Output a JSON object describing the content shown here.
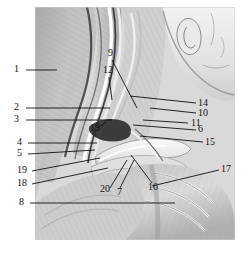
{
  "figure": {
    "view": "right lateral",
    "background_color": "#ffffff",
    "plate_color": "#dcdcdc",
    "ink_color": "#141414",
    "label_count": 20
  },
  "labels": [
    {
      "id": "1",
      "text": "1",
      "tx": 14,
      "ty": 72,
      "lx1": 26,
      "ly1": 70,
      "lx2": 57,
      "ly2": 70
    },
    {
      "id": "2",
      "text": "2",
      "tx": 14,
      "ty": 110,
      "lx1": 26,
      "ly1": 108,
      "lx2": 110,
      "ly2": 108
    },
    {
      "id": "3",
      "text": "3",
      "tx": 14,
      "ty": 122,
      "lx1": 26,
      "ly1": 120,
      "lx2": 112,
      "ly2": 120
    },
    {
      "id": "4",
      "text": "4",
      "tx": 17,
      "ty": 145,
      "lx1": 28,
      "ly1": 143,
      "lx2": 97,
      "ly2": 143
    },
    {
      "id": "5",
      "text": "5",
      "tx": 17,
      "ty": 156,
      "lx1": 28,
      "ly1": 154,
      "lx2": 95,
      "ly2": 150
    },
    {
      "id": "6",
      "text": "6",
      "tx": 198,
      "ty": 132,
      "lx1": 196,
      "ly1": 130,
      "lx2": 133,
      "ly2": 125
    },
    {
      "id": "7",
      "text": "7",
      "tx": 117,
      "ty": 195,
      "lx1": 120,
      "ly1": 188,
      "lx2": 134,
      "ly2": 160
    },
    {
      "id": "8",
      "text": "8",
      "tx": 19,
      "ty": 205,
      "lx1": 30,
      "ly1": 203,
      "lx2": 175,
      "ly2": 203
    },
    {
      "id": "9",
      "text": "9",
      "tx": 108,
      "ty": 56,
      "lx1": 112,
      "ly1": 60,
      "lx2": 137,
      "ly2": 108
    },
    {
      "id": "10",
      "text": "10",
      "tx": 198,
      "ty": 116,
      "lx1": 196,
      "ly1": 113,
      "lx2": 150,
      "ly2": 108
    },
    {
      "id": "11",
      "text": "11",
      "tx": 191,
      "ty": 126,
      "lx1": 188,
      "ly1": 123,
      "lx2": 143,
      "ly2": 120
    },
    {
      "id": "12",
      "text": "12",
      "tx": 103,
      "ty": 73,
      "lx1": 109,
      "ly1": 77,
      "lx2": 112,
      "ly2": 100
    },
    {
      "id": "13",
      "text": "13",
      "tx": 90,
      "ty": 131,
      "lx1": 98,
      "ly1": 128,
      "lx2": 106,
      "ly2": 122
    },
    {
      "id": "14",
      "text": "14",
      "tx": 198,
      "ty": 106,
      "lx1": 196,
      "ly1": 103,
      "lx2": 130,
      "ly2": 96
    },
    {
      "id": "15",
      "text": "15",
      "tx": 205,
      "ty": 145,
      "lx1": 203,
      "ly1": 142,
      "lx2": 140,
      "ly2": 136
    },
    {
      "id": "16",
      "text": "16",
      "tx": 148,
      "ty": 190,
      "lx1": 152,
      "ly1": 183,
      "lx2": 131,
      "ly2": 155
    },
    {
      "id": "17",
      "text": "17",
      "tx": 221,
      "ty": 172,
      "lx1": 219,
      "ly1": 170,
      "lx2": 152,
      "ly2": 186
    },
    {
      "id": "18",
      "text": "18",
      "tx": 17,
      "ty": 186,
      "lx1": 32,
      "ly1": 184,
      "lx2": 108,
      "ly2": 168
    },
    {
      "id": "19",
      "text": "19",
      "tx": 17,
      "ty": 173,
      "lx1": 32,
      "ly1": 171,
      "lx2": 100,
      "ly2": 158
    },
    {
      "id": "20",
      "text": "20",
      "tx": 100,
      "ty": 192,
      "lx1": 110,
      "ly1": 188,
      "lx2": 127,
      "ly2": 160
    }
  ]
}
